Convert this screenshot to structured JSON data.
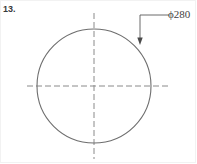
{
  "sheet": {
    "width": 197,
    "height": 164,
    "background_color": "#ffffff",
    "border_color": "#f2f2f2"
  },
  "problem": {
    "number_label": "13."
  },
  "dimension": {
    "label": "ϕ280",
    "diameter_symbol": "ϕ",
    "value": "280",
    "leader": {
      "arrow_tip_x": 140,
      "arrow_tip_y": 44,
      "elbow_x": 140,
      "elbow_y": 15,
      "shelf_end_x": 169,
      "shelf_end_y": 15
    }
  },
  "geometry": {
    "circle": {
      "center_x": 94,
      "center_y": 86,
      "radius": 57,
      "stroke_color": "#6e6e6e",
      "stroke_width": 1
    },
    "horizontal_centerline": {
      "x1": 27,
      "y1": 86,
      "x2": 168,
      "y2": 86,
      "stroke_color": "#8a8a8a",
      "dash": "6,3"
    },
    "vertical_centerline": {
      "x1": 94,
      "y1": 13,
      "x2": 94,
      "y2": 159,
      "stroke_color": "#8a8a8a",
      "dash": "6,3"
    }
  }
}
